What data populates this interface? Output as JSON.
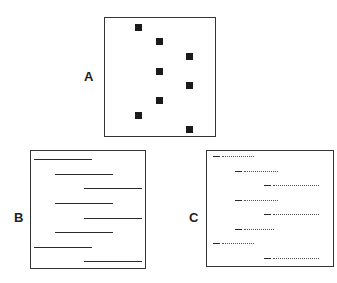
{
  "panels": {
    "A": {
      "label": "A",
      "description": "Scatter of filled squares in three columns"
    },
    "B": {
      "label": "B",
      "description": "Solid horizontal line segments at staggered offsets"
    },
    "C": {
      "label": "C",
      "description": "Dashed-dotted horizontal segments at staggered offsets"
    }
  },
  "colors": {
    "ink": "#1a1a1a",
    "border": "#333333",
    "background": "#ffffff"
  }
}
